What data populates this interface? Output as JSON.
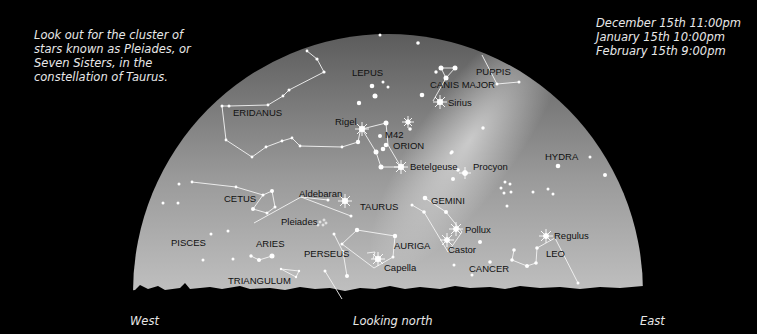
{
  "notes": {
    "intro": [
      "Look out for the cluster of",
      "stars known as Pleiades, or",
      "Seven Sisters, in the",
      "constellation of Taurus."
    ],
    "dates": [
      "December 15th 11:00pm",
      "January 15th 10:00pm",
      "February 15th 9:00pm"
    ]
  },
  "directions": {
    "west": "West",
    "center": "Looking north",
    "east": "East"
  },
  "colors": {
    "background": "#000000",
    "sky_light": "#d8d8d8",
    "sky_dark": "#6a6a6a",
    "label": "#111111",
    "star": "#ffffff",
    "note_text": "#e8e8e8"
  },
  "constellations": [
    {
      "name": "ERIDANUS",
      "x": 233,
      "y": 116
    },
    {
      "name": "LEPUS",
      "x": 352,
      "y": 76
    },
    {
      "name": "PUPPIS",
      "x": 477,
      "y": 74
    },
    {
      "name": "CANIS MAJOR",
      "x": 432,
      "y": 87
    },
    {
      "name": "ORION",
      "x": 393,
      "y": 148
    },
    {
      "name": "HYDRA",
      "x": 608,
      "y": 159
    },
    {
      "name": "CETUS",
      "x": 226,
      "y": 201
    },
    {
      "name": "TAURUS",
      "x": 345,
      "y": 208
    },
    {
      "name": "GEMINI",
      "x": 401,
      "y": 203
    },
    {
      "name": "PISCES",
      "x": 145,
      "y": 245
    },
    {
      "name": "ARIES",
      "x": 253,
      "y": 246
    },
    {
      "name": "PERSEUS",
      "x": 284,
      "y": 256
    },
    {
      "name": "AURIGA",
      "x": 394,
      "y": 248
    },
    {
      "name": "LEO",
      "x": 546,
      "y": 256
    },
    {
      "name": "CANCER",
      "x": 469,
      "y": 271
    },
    {
      "name": "TRIANGULUM",
      "x": 228,
      "y": 283
    }
  ],
  "stars": [
    {
      "name": "Rigel",
      "x": 362,
      "y": 129
    },
    {
      "name": "M42",
      "x": 384,
      "y": 138
    },
    {
      "name": "Sirius",
      "x": 450,
      "y": 106
    },
    {
      "name": "Betelgeuse",
      "x": 402,
      "y": 168
    },
    {
      "name": "Procyon",
      "x": 472,
      "y": 170
    },
    {
      "name": "Aldebaran",
      "x": 301,
      "y": 197
    },
    {
      "name": "Pleiades",
      "x": 254,
      "y": 223
    },
    {
      "name": "Pollux",
      "x": 462,
      "y": 232
    },
    {
      "name": "Castor",
      "x": 448,
      "y": 252
    },
    {
      "name": "Capella",
      "x": 390,
      "y": 270
    },
    {
      "name": "Regulus",
      "x": 555,
      "y": 238
    }
  ]
}
